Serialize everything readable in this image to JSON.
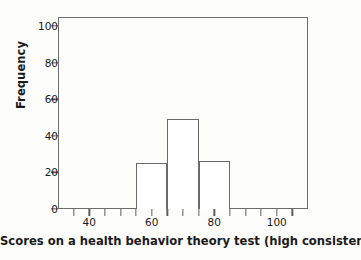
{
  "chart_data": {
    "type": "bar",
    "title": "",
    "subtitle": "",
    "xlabel": "Scores on a health behavior theory test (high consistency)",
    "ylabel": "Frequency",
    "xlim": [
      30,
      110
    ],
    "ylim": [
      0,
      105
    ],
    "grid": false,
    "legend": "none",
    "bin_width": 10,
    "categories": [
      "55-65",
      "65-75",
      "75-85"
    ],
    "bin_edges": [
      55,
      65,
      75,
      85
    ],
    "values": [
      25,
      49,
      26
    ],
    "bars": [
      {
        "label": "55-65",
        "x_start": 55,
        "x_end": 65,
        "value": 25
      },
      {
        "label": "65-75",
        "x_start": 65,
        "x_end": 75,
        "value": 49
      },
      {
        "label": "75-85",
        "x_start": 75,
        "x_end": 85,
        "value": 26
      }
    ],
    "y_ticks": [
      {
        "value": 0,
        "label": "0"
      },
      {
        "value": 20,
        "label": "20"
      },
      {
        "value": 40,
        "label": "40"
      },
      {
        "value": 60,
        "label": "60"
      },
      {
        "value": 80,
        "label": "80"
      },
      {
        "value": 100,
        "label": "100"
      }
    ],
    "x_ticks": [
      {
        "value": 35,
        "label": ""
      },
      {
        "value": 40,
        "label": "40"
      },
      {
        "value": 45,
        "label": ""
      },
      {
        "value": 50,
        "label": ""
      },
      {
        "value": 55,
        "label": ""
      },
      {
        "value": 60,
        "label": "60"
      },
      {
        "value": 65,
        "label": ""
      },
      {
        "value": 70,
        "label": ""
      },
      {
        "value": 75,
        "label": ""
      },
      {
        "value": 80,
        "label": "80"
      },
      {
        "value": 85,
        "label": ""
      },
      {
        "value": 90,
        "label": ""
      },
      {
        "value": 95,
        "label": ""
      },
      {
        "value": 100,
        "label": "100"
      },
      {
        "value": 105,
        "label": ""
      }
    ],
    "colors": {
      "bar_fill": "#ffffff",
      "bar_stroke": "#6a6a6a",
      "axis": "#6c6c6c",
      "text": "#1a1a1a",
      "background": "#fdfdfc"
    }
  }
}
